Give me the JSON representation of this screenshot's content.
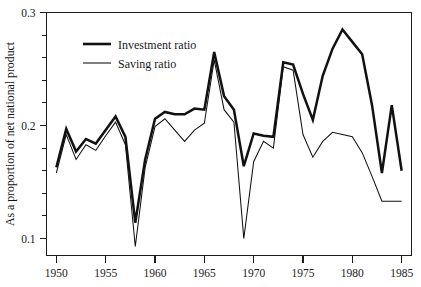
{
  "chart_data": {
    "type": "line",
    "title": "",
    "xlabel": "",
    "ylabel": "As a proportion of net national product",
    "xlim": [
      1949,
      1986
    ],
    "ylim": [
      0.085,
      0.3
    ],
    "grid": false,
    "legend_position": "top-left-inside",
    "x_ticks": [
      1950,
      1955,
      1960,
      1965,
      1970,
      1975,
      1980,
      1985
    ],
    "x_tick_labels": [
      "1950",
      "1955",
      "1960",
      "1965",
      "1970",
      "1975",
      "1980",
      "1985"
    ],
    "y_ticks": [
      0.1,
      0.2,
      0.3
    ],
    "y_tick_labels": [
      "0.1",
      "0.2",
      "0.3"
    ],
    "y_minor_ticks": [
      0.12,
      0.14,
      0.16,
      0.18,
      0.22,
      0.24,
      0.26,
      0.28
    ],
    "x": [
      1950,
      1951,
      1952,
      1953,
      1954,
      1955,
      1956,
      1957,
      1958,
      1959,
      1960,
      1961,
      1962,
      1963,
      1964,
      1965,
      1966,
      1967,
      1968,
      1969,
      1970,
      1971,
      1972,
      1973,
      1974,
      1975,
      1976,
      1977,
      1978,
      1979,
      1980,
      1981,
      1982,
      1983,
      1984,
      1985
    ],
    "series": [
      {
        "name": "Investment ratio",
        "color": "#111111",
        "line_width": "thick",
        "values": [
          0.163,
          0.197,
          0.177,
          0.188,
          0.184,
          0.196,
          0.208,
          0.19,
          0.114,
          0.17,
          0.206,
          0.212,
          0.21,
          0.21,
          0.215,
          0.214,
          0.265,
          0.226,
          0.214,
          0.164,
          0.193,
          0.191,
          0.19,
          0.256,
          0.254,
          0.228,
          0.205,
          0.244,
          0.268,
          0.285,
          0.274,
          0.263,
          0.218,
          0.158,
          0.218,
          0.16
        ]
      },
      {
        "name": "Saving ratio",
        "color": "#111111",
        "line_width": "thin",
        "values": [
          0.158,
          0.192,
          0.17,
          0.183,
          0.178,
          0.191,
          0.203,
          0.183,
          0.093,
          0.163,
          0.199,
          0.206,
          0.196,
          0.186,
          0.196,
          0.202,
          0.258,
          0.214,
          0.203,
          0.1,
          0.168,
          0.186,
          0.18,
          0.252,
          0.249,
          0.192,
          0.172,
          0.186,
          0.194,
          0.192,
          0.19,
          0.176,
          0.155,
          0.133,
          0.133,
          0.133
        ]
      }
    ]
  },
  "legend": {
    "items": [
      {
        "label": "Investment ratio",
        "style": "thick"
      },
      {
        "label": "Saving ratio",
        "style": "thin"
      }
    ]
  },
  "axes": {
    "y_title": "As a proportion of net national product"
  }
}
